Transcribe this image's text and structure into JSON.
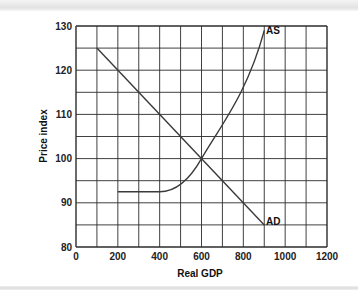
{
  "chart_data": {
    "type": "line",
    "title": "",
    "xlabel": "Real GDP",
    "ylabel": "Price index",
    "xlim": [
      0,
      1200
    ],
    "ylim": [
      80,
      130
    ],
    "x_ticks": [
      0,
      200,
      400,
      600,
      800,
      1000,
      1200
    ],
    "y_ticks": [
      80,
      90,
      100,
      110,
      120,
      130
    ],
    "x_grid_step": 100,
    "y_grid_step": 5,
    "grid": true,
    "legend": "none (curves labeled inline)",
    "series": [
      {
        "name": "AD",
        "label": "AD",
        "x": [
          100,
          200,
          300,
          400,
          500,
          600,
          700,
          800,
          900
        ],
        "y": [
          125,
          121.25,
          117.5,
          113.75,
          110,
          106.25,
          102.5,
          98.75,
          95
        ],
        "note": "straight downward-sloping line from (100,125) to (900,85)"
      },
      {
        "name": "AS",
        "label": "AS",
        "x": [
          200,
          300,
          400,
          450,
          500,
          550,
          600,
          700,
          800,
          900
        ],
        "y": [
          92.5,
          92.5,
          92.5,
          93,
          94.5,
          97,
          100,
          107.5,
          115,
          129
        ],
        "note": "flat at ~92.5 from 200 to 400, then curves upward through (600,100) to ~(900,129)"
      }
    ],
    "intersection": {
      "x": 600,
      "y": 100
    }
  },
  "labels": {
    "x_axis": "Real GDP",
    "y_axis": "Price index",
    "ad": "AD",
    "as": "AS",
    "x_ticks": [
      "0",
      "200",
      "400",
      "600",
      "800",
      "1000",
      "1200"
    ],
    "y_ticks": [
      "80",
      "90",
      "100",
      "110",
      "120",
      "130"
    ]
  },
  "colors": {
    "grid": "#2b2b2b",
    "curve": "#333333",
    "text": "#111111"
  }
}
